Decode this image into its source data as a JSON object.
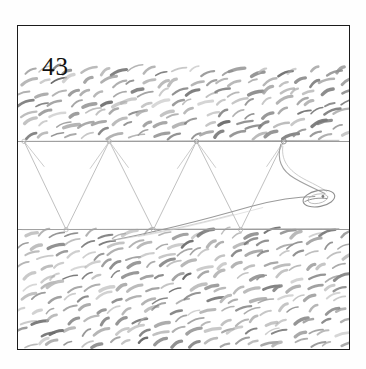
{
  "plate": {
    "number": "43",
    "frame_color": "#1b1b1b",
    "background_color": "#ffffff",
    "ink_color": "#5a5a5a",
    "texture_color": "#6e6e6e"
  },
  "figure": {
    "title": "43",
    "bands": [
      {
        "name": "upper-hatch-band",
        "top": 42,
        "height": 73,
        "rows": 7,
        "strokes_per_row": 22
      },
      {
        "name": "lower-hatch-band",
        "top": 203,
        "height": 120,
        "rows": 11,
        "strokes_per_row": 22
      }
    ],
    "truss": {
      "top_chord_y": 115,
      "bottom_chord_y": 203,
      "top_nodes_x": [
        6,
        91,
        178,
        265
      ],
      "bottom_nodes_x": [
        48,
        135,
        222
      ]
    },
    "creature": {
      "name": "eel-form",
      "head_center_x": 300,
      "head_center_y": 172,
      "head_rx": 16,
      "head_ry": 8,
      "tail_tip_x": 92,
      "tail_tip_y": 214
    }
  }
}
